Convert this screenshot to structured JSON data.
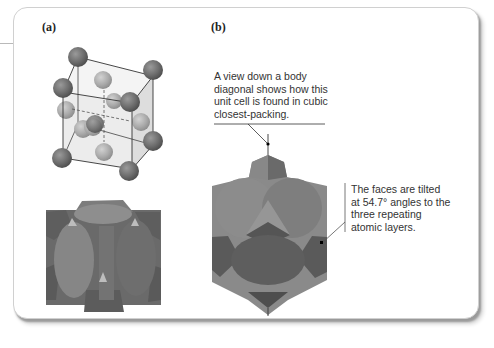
{
  "figure": {
    "panels": [
      {
        "id": "a",
        "label": "(a)"
      },
      {
        "id": "b",
        "label": "(b)"
      }
    ],
    "annotations": {
      "body_diagonal": [
        "A view down a body",
        "diagonal shows how this",
        "unit cell is found in cubic",
        "closest-packing."
      ],
      "tilted_faces": [
        "The faces are tilted",
        "at 54.7° angles to the",
        "three repeating",
        "atomic layers."
      ]
    },
    "colors": {
      "corner_atom": "#6f6f6f",
      "face_atom": "#a9a9a9",
      "solid_dark": "#5c5c5c",
      "solid_mid": "#7c7c7c",
      "solid_light": "#9a9a9a",
      "cell_fill": "#dcdcdc",
      "text": "#333333"
    }
  }
}
